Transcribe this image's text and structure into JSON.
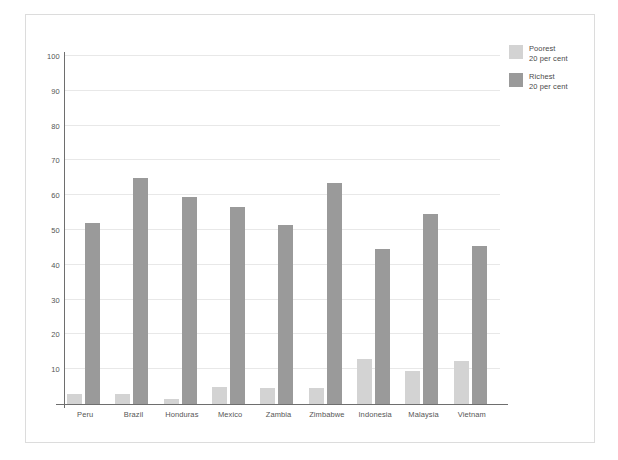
{
  "chart_data": {
    "type": "bar",
    "title": "",
    "subtitle": "",
    "xlabel": "",
    "ylabel": "",
    "ylim": [
      0,
      100
    ],
    "yticks": [
      10,
      20,
      30,
      40,
      50,
      60,
      70,
      80,
      90,
      100
    ],
    "ytick_labels": [
      "10",
      "20",
      "30",
      "40",
      "50",
      "60",
      "70",
      "80",
      "90",
      "100"
    ],
    "grid": true,
    "legend_position": "top-right",
    "categories": [
      "Peru",
      "Brazil",
      "Honduras",
      "Mexico",
      "Zambia",
      "Zimbabwe",
      "Indonesia",
      "Malaysia",
      "Vietnam"
    ],
    "series": [
      {
        "name": "Poorest",
        "legend_line1": "Poorest",
        "legend_line2": "20 per cent",
        "color": "#d3d3d3",
        "values": [
          3,
          3,
          1.5,
          5,
          4.5,
          4.5,
          13,
          9.5,
          12.5
        ]
      },
      {
        "name": "Richest",
        "legend_line1": "Richest",
        "legend_line2": "20 per cent",
        "color": "#9a9a9a",
        "values": [
          52,
          65,
          59.5,
          56.5,
          51.5,
          63.5,
          44.5,
          54.5,
          45.5
        ]
      }
    ]
  },
  "style": {
    "frame_border_color": "#dcdcdc",
    "gridline_color": "#e8e8e8",
    "axis_color": "#6e6e6e",
    "tick_label_color": "#555555",
    "legend_text_color": "#4a4a4a",
    "background": "#ffffff"
  }
}
